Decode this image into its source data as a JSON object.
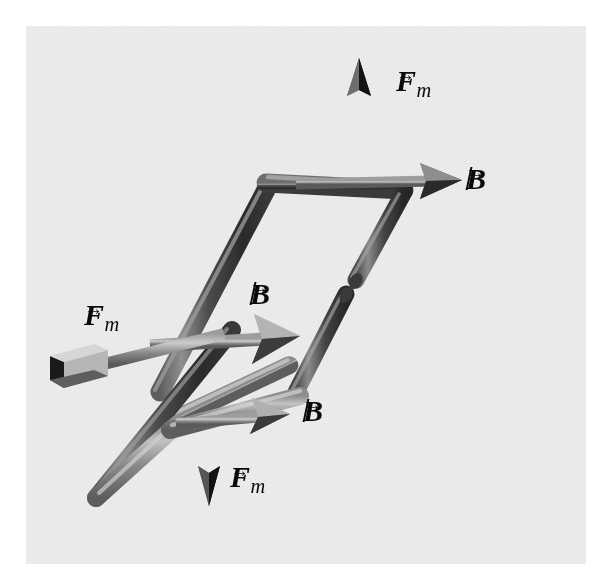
{
  "figure": {
    "background_color": "#ededed",
    "paper_color": "#ffffff",
    "ink_color": "#0a0a0a",
    "wire_color": "#5a5a5a",
    "wire_highlight": "#b9b9b9",
    "wire_shadow": "#2e2e2e",
    "arrow_color": "#6a6a6a",
    "width": 608,
    "height": 576
  },
  "labels": [
    {
      "id": "fm-top",
      "symbol": "F",
      "subscript": "m",
      "accent": "vector-arrow",
      "text": "F_m",
      "x": 396,
      "y": 66,
      "font_size": 30
    },
    {
      "id": "b-top-right",
      "symbol": "B",
      "subscript": "",
      "accent": "vector-arrow",
      "text": "B",
      "x": 466,
      "y": 164,
      "font_size": 30
    },
    {
      "id": "b-middle",
      "symbol": "B",
      "subscript": "",
      "accent": "vector-arrow",
      "text": "B",
      "x": 250,
      "y": 279,
      "font_size": 30
    },
    {
      "id": "fm-left",
      "symbol": "F",
      "subscript": "m",
      "accent": "vector-arrow",
      "text": "F_m",
      "x": 84,
      "y": 300,
      "font_size": 30
    },
    {
      "id": "b-bottom-right",
      "symbol": "B",
      "subscript": "",
      "accent": "vector-arrow",
      "text": "B",
      "x": 303,
      "y": 396,
      "font_size": 30
    },
    {
      "id": "fm-bottom",
      "symbol": "F",
      "subscript": "m",
      "accent": "vector-arrow",
      "text": "F_m",
      "x": 230,
      "y": 462,
      "font_size": 30
    }
  ],
  "vectors": [
    {
      "id": "force-up",
      "kind": "force",
      "label": "F_m",
      "direction": "up",
      "tail": [
        358,
        188
      ],
      "head": [
        358,
        62
      ]
    },
    {
      "id": "field-top-right",
      "kind": "field",
      "label": "B",
      "direction": "right",
      "tail": [
        300,
        183
      ],
      "head": [
        455,
        180
      ]
    },
    {
      "id": "field-middle",
      "kind": "field",
      "label": "B",
      "direction": "right",
      "tail": [
        150,
        344
      ],
      "head": [
        292,
        336
      ]
    },
    {
      "id": "force-left",
      "kind": "force",
      "label": "F_m",
      "direction": "left",
      "tail": [
        215,
        336
      ],
      "head": [
        62,
        374
      ]
    },
    {
      "id": "field-bottom-right",
      "kind": "field",
      "label": "B",
      "direction": "right",
      "tail": [
        178,
        422
      ],
      "head": [
        288,
        415
      ]
    },
    {
      "id": "force-down",
      "kind": "force",
      "label": "F_m",
      "direction": "down",
      "tail": [
        208,
        408
      ],
      "head": [
        208,
        500
      ]
    }
  ],
  "loop": {
    "shape": "parallelogram",
    "has_terminal_gap": true,
    "gap_position": [
      352,
      286
    ],
    "corners": {
      "top_left": [
        264,
        182
      ],
      "top_right": [
        400,
        188
      ],
      "bottom_right": [
        292,
        398
      ],
      "bottom_left": [
        152,
        392
      ]
    }
  }
}
